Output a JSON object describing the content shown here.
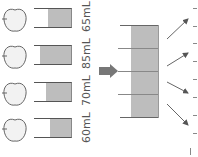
{
  "diagram": {
    "apples": [
      {
        "label": "65mL",
        "fill_fraction": 0.65
      },
      {
        "label": "85mL",
        "fill_fraction": 0.85
      },
      {
        "label": "70mL",
        "fill_fraction": 0.7
      },
      {
        "label": "60mL",
        "fill_fraction": 0.6
      }
    ],
    "combined_container": {
      "segments": 4
    },
    "arrows_out": 4,
    "colors": {
      "liquid": "#bdbdbd",
      "outline": "#555555",
      "arrow": "#777777"
    }
  }
}
